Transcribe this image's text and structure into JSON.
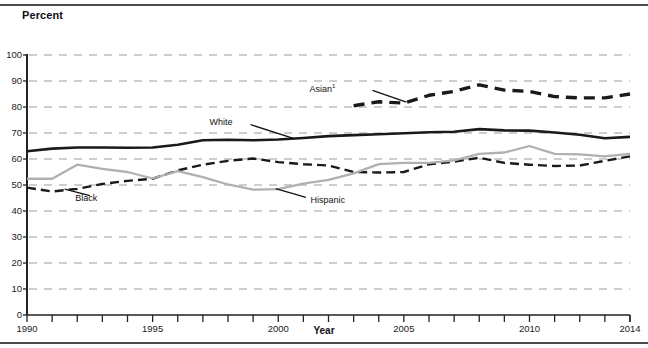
{
  "figure": {
    "ylabel": "Percent",
    "xlabel": "Year",
    "top_rule": "horizontal-rule",
    "bottom_rule": "horizontal-rule"
  },
  "chart_data": {
    "type": "line",
    "title": "",
    "xlabel": "Year",
    "ylabel": "Percent",
    "xlim": [
      1990,
      2014
    ],
    "ylim": [
      0,
      100
    ],
    "ytick_values": [
      0,
      10,
      20,
      30,
      40,
      50,
      60,
      70,
      80,
      90,
      100
    ],
    "ytick_labels": [
      "0",
      "10",
      "20",
      "30",
      "40",
      "50",
      "60",
      "70",
      "80",
      "90",
      "100"
    ],
    "xtick_values": [
      1990,
      1991,
      1992,
      1993,
      1994,
      1995,
      1996,
      1997,
      1998,
      1999,
      2000,
      2001,
      2002,
      2003,
      2004,
      2005,
      2006,
      2007,
      2008,
      2009,
      2010,
      2011,
      2012,
      2013,
      2014
    ],
    "xtick_labels_shown": [
      "1990",
      "1995",
      "2000",
      "2005",
      "2010",
      "2014"
    ],
    "grid": "horizontal-dashed",
    "legend": "inline-annotations",
    "series": [
      {
        "name": "White",
        "style": "solid",
        "color": "#1a1a1a",
        "label": "White",
        "x": [
          1990,
          1991,
          1992,
          1993,
          1994,
          1995,
          1996,
          1997,
          1998,
          1999,
          2000,
          2001,
          2002,
          2003,
          2004,
          2005,
          2006,
          2007,
          2008,
          2009,
          2010,
          2011,
          2012,
          2013,
          2014
        ],
        "values": [
          63.0,
          64.0,
          64.4,
          64.4,
          64.3,
          64.4,
          65.5,
          67.2,
          67.4,
          67.2,
          67.5,
          68.1,
          68.8,
          69.2,
          69.5,
          69.9,
          70.3,
          70.5,
          71.5,
          71.0,
          70.9,
          70.2,
          69.3,
          68.0,
          68.5
        ],
        "label_xy": [
          1997.5,
          74.0
        ]
      },
      {
        "name": "Black",
        "style": "dashed",
        "color": "#1a1a1a",
        "label": "Black",
        "x": [
          1990,
          1991,
          1992,
          1993,
          1994,
          1995,
          1996,
          1997,
          1998,
          1999,
          2000,
          2001,
          2002,
          2003,
          2004,
          2005,
          2006,
          2007,
          2008,
          2009,
          2010,
          2011,
          2012,
          2013,
          2014
        ],
        "values": [
          49.0,
          47.5,
          48.5,
          50.4,
          51.6,
          52.4,
          55.6,
          57.8,
          59.3,
          60.2,
          58.8,
          58.0,
          57.5,
          55.0,
          54.8,
          55.0,
          58.0,
          59.0,
          60.5,
          58.5,
          57.8,
          57.3,
          57.5,
          59.3,
          61.0
        ],
        "label_xy": [
          1992.0,
          44.5
        ]
      },
      {
        "name": "Hispanic",
        "style": "solid",
        "color": "#b0b0b0",
        "label": "Hispanic",
        "x": [
          1990,
          1991,
          1992,
          1993,
          1994,
          1995,
          1996,
          1997,
          1998,
          1999,
          2000,
          2001,
          2002,
          2003,
          2004,
          2005,
          2006,
          2007,
          2008,
          2009,
          2010,
          2011,
          2012,
          2013,
          2014
        ],
        "values": [
          52.4,
          52.4,
          57.8,
          56.2,
          55.0,
          52.5,
          55.3,
          53.0,
          50.2,
          48.2,
          48.4,
          50.5,
          52.0,
          54.5,
          58.0,
          58.5,
          58.5,
          59.5,
          62.0,
          62.5,
          65.0,
          62.0,
          61.8,
          61.0,
          62.0
        ],
        "label_xy": [
          2001.2,
          44.0
        ]
      },
      {
        "name": "Asian",
        "style": "dashed-heavy",
        "color": "#1a1a1a",
        "label": "Asian",
        "label_superscript": "1",
        "x": [
          2003,
          2004,
          2005,
          2006,
          2007,
          2008,
          2009,
          2010,
          2011,
          2012,
          2013,
          2014
        ],
        "values": [
          80.5,
          82.0,
          81.5,
          84.5,
          86.0,
          88.5,
          86.5,
          86.0,
          84.0,
          83.5,
          83.5,
          85.0
        ],
        "label_xy": [
          2002.6,
          87.0
        ]
      }
    ]
  },
  "annotations": {
    "white_label": "White",
    "black_label": "Black",
    "hispanic_label": "Hispanic",
    "asian_label": "Asian",
    "asian_footnote_marker": "1"
  }
}
